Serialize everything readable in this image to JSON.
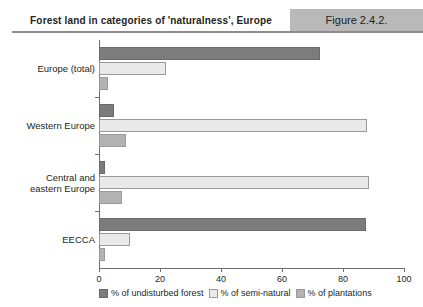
{
  "header": {
    "title": "Forest land in categories of 'naturalness', Europe",
    "figure_number": "Figure 2.4.2.",
    "band_color": "#b9b9b9"
  },
  "chart_data": {
    "type": "bar",
    "orientation": "horizontal",
    "title": "Forest land in categories of 'naturalness', Europe",
    "xlabel": "",
    "ylabel": "",
    "xlim": [
      0,
      100
    ],
    "xticks": [
      0,
      20,
      40,
      60,
      80,
      100
    ],
    "xtick_labels": [
      "0",
      "20",
      "40",
      "60",
      "80",
      "100"
    ],
    "grid": false,
    "legend_position": "bottom",
    "categories": [
      "Europe (total)",
      "Western Europe",
      "Central and eastern Europe",
      "EECCA"
    ],
    "series": [
      {
        "name": "% of undisturbed forest",
        "color": "#7c7c7c",
        "values": [
          72.5,
          5.0,
          2.0,
          87.5
        ]
      },
      {
        "name": "% of semi-natural",
        "color": "#e9e9e9",
        "values": [
          22.0,
          88.0,
          88.5,
          10.0
        ]
      },
      {
        "name": "% of plantations",
        "color": "#b3b3b3",
        "values": [
          3.0,
          9.0,
          7.5,
          2.0
        ]
      }
    ]
  }
}
